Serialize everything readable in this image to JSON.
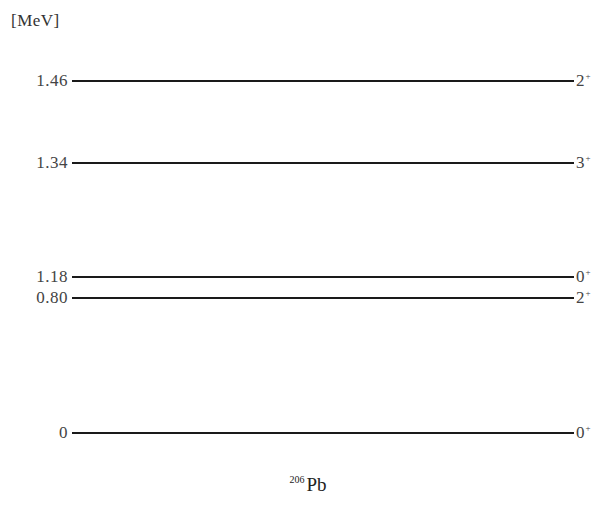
{
  "diagram": {
    "unit_label": "[MeV]",
    "nucleus": {
      "mass_number": "206",
      "symbol": "Pb"
    },
    "levels": [
      {
        "energy": "1.46",
        "spin": "2",
        "parity": "+",
        "y": 81
      },
      {
        "energy": "1.34",
        "spin": "3",
        "parity": "+",
        "y": 163
      },
      {
        "energy": "1.18",
        "spin": "0",
        "parity": "+",
        "y": 277
      },
      {
        "energy": "0.80",
        "spin": "2",
        "parity": "+",
        "y": 298
      },
      {
        "energy": "0",
        "spin": "0",
        "parity": "+",
        "y": 433
      }
    ]
  }
}
